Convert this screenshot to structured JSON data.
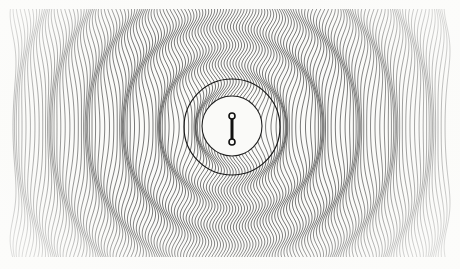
{
  "artwork": {
    "title": "Radial Ripple Line Field",
    "kind": "generative-line-art",
    "canvas": {
      "width": 460,
      "height": 269
    },
    "background_color": "#fbfbf9",
    "paper_color": "#f7f7f4",
    "ink_color": "#1b1b1b"
  },
  "field": {
    "description": "Dense vertical hatch lines displaced horizontally by a radial sine wave, producing concentric moire rings.",
    "line_count": 148,
    "line_spacing_px": 2.92,
    "line_width_px": 0.62,
    "margin": {
      "left": 13,
      "right": 13,
      "top": 9,
      "bottom": 11
    },
    "field_left": 13,
    "field_right": 447,
    "field_top": 9,
    "field_bottom": 258,
    "sample_step_px": 2.0,
    "wave": {
      "center_x": 232,
      "center_y": 127,
      "wavelength_px": 36.5,
      "amplitude_px": 5.6,
      "phase_deg": 0,
      "falloff": "1/(1+r/260)",
      "y_squash": 1.0
    },
    "ring_count_visible": 7,
    "ring_radii_px": [
      48,
      84,
      120,
      157,
      193,
      230,
      266
    ]
  },
  "center_disc": {
    "name": "white-disc",
    "center_x": 232,
    "center_y": 126,
    "radius_px": 30,
    "fill": "#fafaf8",
    "stroke": "#1f1f1f",
    "stroke_width_px": 1.1
  },
  "outer_ring": {
    "name": "dark-ring-outline",
    "center_x": 232,
    "center_y": 127,
    "radius_px": 48,
    "stroke": "#171717",
    "stroke_width_px": 1.15,
    "fill": "none"
  },
  "glyph": {
    "name": "dumbbell-glyph",
    "description": "Vertical bar with a small open circle at each end, centered in the white disc.",
    "bar": {
      "x": 232,
      "y_top": 118,
      "y_bottom": 140,
      "width_px": 3.0,
      "color": "#111111"
    },
    "top_node": {
      "cx": 232,
      "cy": 116,
      "r": 3.0,
      "fill": "#fafaf8",
      "stroke": "#111111",
      "stroke_width_px": 1.6
    },
    "bottom_node": {
      "cx": 232,
      "cy": 142,
      "r": 3.0,
      "fill": "#fafaf8",
      "stroke": "#111111",
      "stroke_width_px": 1.6
    }
  },
  "palette": {
    "ink": "#1b1b1b",
    "ink_soft": "#3a3a3a",
    "paper": "#fbfbf9",
    "disc": "#fafaf8",
    "edge_fade": "#ffffff"
  }
}
